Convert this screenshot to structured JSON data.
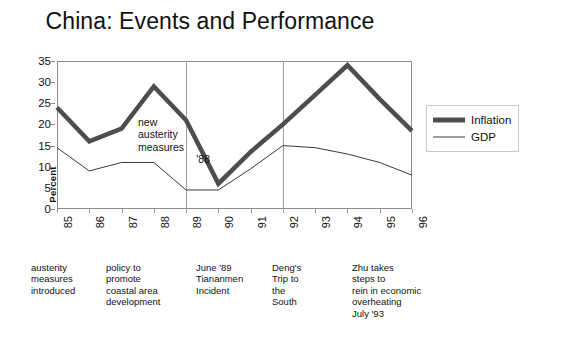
{
  "title": "China: Events and Performance",
  "axes": {
    "ylabel": "Percent",
    "yticks": [
      "0",
      "5",
      "10",
      "15",
      "20",
      "25",
      "30",
      "35"
    ],
    "xticks": [
      "85",
      "86",
      "87",
      "88",
      "89",
      "90",
      "91",
      "92",
      "93",
      "94",
      "95",
      "96"
    ]
  },
  "legend": {
    "items": [
      {
        "label": "Inflation",
        "swatch": "thick-line-swatch"
      },
      {
        "label": "GDP",
        "swatch": "thin-line-swatch"
      }
    ]
  },
  "inplot_annotation": {
    "line1": "new",
    "line2": "austerity",
    "line3": "measures",
    "year": "'88"
  },
  "event_notes": [
    {
      "text": "austerity\nmeasures\nintroduced",
      "x": 31,
      "width": 70
    },
    {
      "text": "policy to\npromote\ncoastal area\ndevelopment",
      "x": 106,
      "width": 76
    },
    {
      "text": "June '89\nTiananmen\nIncident",
      "x": 196,
      "width": 72
    },
    {
      "text": "Deng's\nTrip to\nthe\nSouth",
      "x": 272,
      "width": 62
    },
    {
      "text": "Zhu takes\nsteps to\nrein in economic\noverheating\nJuly '93",
      "x": 352,
      "width": 92
    }
  ],
  "colors": {
    "inflation": "#4d4d4d",
    "gdp": "#3a3a3a",
    "frame": "#8c8c8c",
    "event_line": "#9a9a9a",
    "background": "#ffffff"
  },
  "chart_data": {
    "type": "line",
    "title": "China: Events and Performance",
    "xlabel": "",
    "ylabel": "Percent",
    "categories": [
      "85",
      "86",
      "87",
      "88",
      "89",
      "90",
      "91",
      "92",
      "93",
      "94",
      "95",
      "96"
    ],
    "ylim": [
      0,
      35
    ],
    "ytick_step": 5,
    "grid": false,
    "legend_position": "right",
    "series": [
      {
        "name": "Inflation",
        "color": "#4d4d4d",
        "line_width": 4.5,
        "values": [
          24,
          16,
          19,
          29,
          21,
          6,
          13.5,
          20,
          27,
          34,
          26,
          18.5
        ]
      },
      {
        "name": "GDP",
        "color": "#3a3a3a",
        "line_width": 1,
        "values": [
          14.5,
          9,
          11,
          11,
          4.5,
          4.5,
          9.5,
          15,
          14.5,
          13,
          11,
          8
        ]
      }
    ],
    "event_markers": [
      {
        "at": "89",
        "type": "vertical-line"
      },
      {
        "at": "92",
        "type": "vertical-line"
      }
    ],
    "annotations": [
      {
        "text": "new austerity measures '88",
        "placement": "inside-plot"
      },
      {
        "text": "austerity measures introduced",
        "placement": "below-axis",
        "near": "85"
      },
      {
        "text": "policy to promote coastal area development",
        "placement": "below-axis",
        "near": "87"
      },
      {
        "text": "June '89 Tiananmen Incident",
        "placement": "below-axis",
        "near": "89"
      },
      {
        "text": "Deng's Trip to the South",
        "placement": "below-axis",
        "near": "92"
      },
      {
        "text": "Zhu takes steps to rein in economic overheating July '93",
        "placement": "below-axis",
        "near": "93"
      }
    ]
  }
}
